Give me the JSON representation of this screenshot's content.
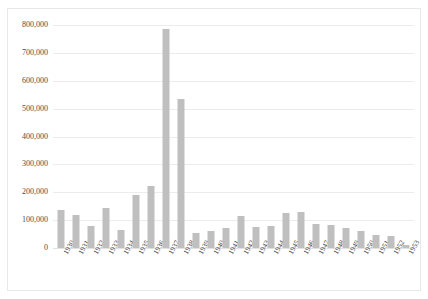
{
  "chart_data": {
    "type": "bar",
    "title": "",
    "subtitle": "",
    "xlabel": "",
    "ylabel": "",
    "ylim": [
      0,
      800000
    ],
    "ytick_values": [
      0,
      100000,
      200000,
      300000,
      400000,
      500000,
      600000,
      700000,
      800000
    ],
    "ytick_labels": [
      "0",
      "100,000",
      "200,000",
      "300,000",
      "400,000",
      "500,000",
      "600,000",
      "700,000",
      "800,000"
    ],
    "grid": true,
    "legend": "none",
    "bar_color": "#bfbfbf",
    "gridline_color": "#ececec",
    "categories": [
      "1930",
      "1931",
      "1932",
      "1933",
      "1934",
      "1935",
      "1936",
      "1937",
      "1938",
      "1939",
      "1940",
      "1941",
      "1942",
      "1943",
      "1944",
      "1945",
      "1946",
      "1947",
      "1948",
      "1949",
      "1950",
      "1951",
      "1952",
      "1953"
    ],
    "values": [
      135000,
      118000,
      80000,
      145000,
      65000,
      190000,
      222000,
      785000,
      535000,
      55000,
      62000,
      72000,
      115000,
      75000,
      78000,
      125000,
      128000,
      85000,
      82000,
      72000,
      62000,
      45000,
      42000,
      12000
    ]
  }
}
